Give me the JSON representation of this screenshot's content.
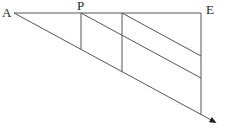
{
  "figure": {
    "width": 248,
    "height": 132,
    "background": "#ffffff",
    "stroke_color": "#565656",
    "label_color": "#1e1e1e",
    "labels": [
      {
        "id": "point-label-A",
        "text": "A",
        "x": 2,
        "y": 17
      },
      {
        "id": "point-label-P",
        "text": "P",
        "x": 77,
        "y": 10
      },
      {
        "id": "point-label-E",
        "text": "E",
        "x": 206,
        "y": 14
      }
    ],
    "lines": [
      {
        "id": "line-A-E-horizontal",
        "x1": 14,
        "y1": 13,
        "x2": 201,
        "y2": 13,
        "arrow": false
      },
      {
        "id": "ray-A-transversal",
        "x1": 14,
        "y1": 13,
        "x2": 213,
        "y2": 121,
        "arrow": true
      },
      {
        "id": "segment-P-vertical",
        "x1": 81,
        "y1": 13,
        "x2": 81,
        "y2": 49,
        "arrow": false
      },
      {
        "id": "segment-mid-vertical",
        "x1": 122,
        "y1": 13,
        "x2": 122,
        "y2": 72,
        "arrow": false
      },
      {
        "id": "segment-E-vertical",
        "x1": 201,
        "y1": 13,
        "x2": 201,
        "y2": 115,
        "arrow": false
      },
      {
        "id": "segment-parallel-from-P",
        "x1": 81,
        "y1": 13,
        "x2": 201,
        "y2": 78,
        "arrow": false
      },
      {
        "id": "segment-parallel-from-mid",
        "x1": 122,
        "y1": 13,
        "x2": 201,
        "y2": 56,
        "arrow": false
      }
    ]
  }
}
